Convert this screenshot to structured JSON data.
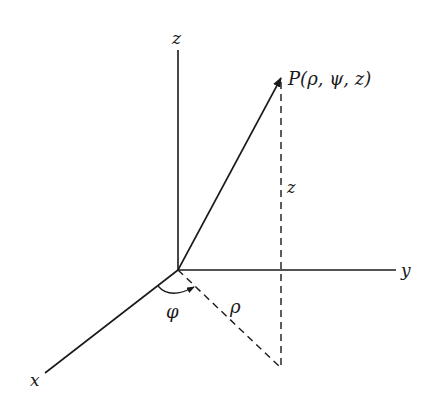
{
  "diagram": {
    "axes": {
      "z_label": "z",
      "y_label": "y",
      "x_label": "x"
    },
    "point_label": "P(ρ, ψ, z)",
    "height_label": "z",
    "radius_label": "ρ",
    "angle_label": "φ",
    "colors": {
      "line": "#1a1a1a",
      "background": "#ffffff"
    }
  }
}
